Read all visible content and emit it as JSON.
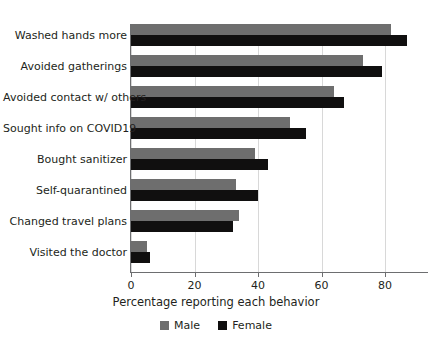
{
  "chart_data": {
    "type": "bar",
    "orientation": "horizontal",
    "title": "",
    "xlabel": "Percentage reporting each behavior",
    "ylabel": "",
    "xlim": [
      0,
      90
    ],
    "xticks": [
      0,
      20,
      40,
      60,
      80
    ],
    "grid": "vertical",
    "legend_position": "bottom",
    "categories": [
      "Washed hands more",
      "Avoided gatherings",
      "Avoided contact w/ others",
      "Sought info on COVID19",
      "Bought sanitizer",
      "Self-quarantined",
      "Changed travel plans",
      "Visited the doctor"
    ],
    "series": [
      {
        "name": "Male",
        "color": "#6e6e6e",
        "values": [
          82,
          73,
          64,
          50,
          39,
          33,
          34,
          5
        ]
      },
      {
        "name": "Female",
        "color": "#100f0f",
        "values": [
          87,
          79,
          67,
          55,
          43,
          40,
          32,
          6
        ]
      }
    ]
  },
  "axis": {
    "tick_labels": [
      "0",
      "20",
      "40",
      "60",
      "80"
    ],
    "x_title": "Percentage reporting each behavior"
  },
  "legend": {
    "items": [
      {
        "label": "Male",
        "swatch": "male-swatch"
      },
      {
        "label": "Female",
        "swatch": "female-swatch"
      }
    ]
  }
}
